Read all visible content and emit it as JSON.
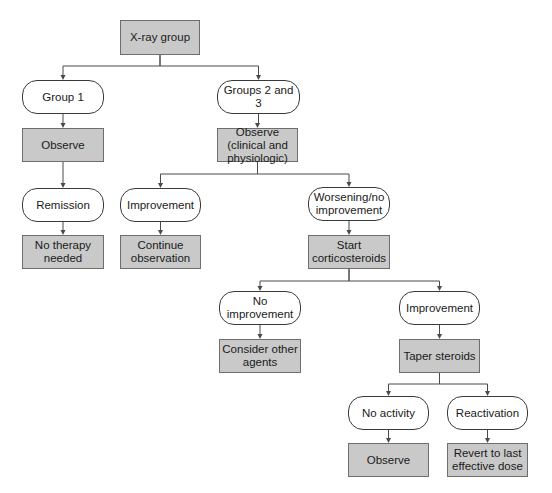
{
  "diagram": {
    "type": "flowchart",
    "nodes": {
      "xray": {
        "label": "X-ray group",
        "kind": "action"
      },
      "group1": {
        "label": "Group 1",
        "kind": "state"
      },
      "groups23": {
        "label": "Groups 2 and 3",
        "kind": "state"
      },
      "observe1": {
        "label": "Observe",
        "kind": "action"
      },
      "observe_clin": {
        "label": "Observe (clinical and physiologic)",
        "kind": "action"
      },
      "remission": {
        "label": "Remission",
        "kind": "state"
      },
      "improvement1": {
        "label": "Improvement",
        "kind": "state"
      },
      "worsening": {
        "label": "Worsening/no improvement",
        "kind": "state"
      },
      "no_therapy": {
        "label": "No therapy needed",
        "kind": "action"
      },
      "continue_obs": {
        "label": "Continue observation",
        "kind": "action"
      },
      "start_cortico": {
        "label": "Start corticosteroids",
        "kind": "action"
      },
      "no_improvement": {
        "label": "No improvement",
        "kind": "state"
      },
      "improvement2": {
        "label": "Improvement",
        "kind": "state"
      },
      "consider_other": {
        "label": "Consider other agents",
        "kind": "action"
      },
      "taper": {
        "label": "Taper steroids",
        "kind": "action"
      },
      "no_activity": {
        "label": "No activity",
        "kind": "state"
      },
      "reactivation": {
        "label": "Reactivation",
        "kind": "state"
      },
      "observe3": {
        "label": "Observe",
        "kind": "action"
      },
      "revert": {
        "label": "Revert to last effective dose",
        "kind": "action"
      }
    },
    "edges": [
      [
        "xray",
        "group1"
      ],
      [
        "xray",
        "groups23"
      ],
      [
        "group1",
        "observe1"
      ],
      [
        "observe1",
        "remission"
      ],
      [
        "remission",
        "no_therapy"
      ],
      [
        "groups23",
        "observe_clin"
      ],
      [
        "observe_clin",
        "improvement1"
      ],
      [
        "observe_clin",
        "worsening"
      ],
      [
        "improvement1",
        "continue_obs"
      ],
      [
        "worsening",
        "start_cortico"
      ],
      [
        "start_cortico",
        "no_improvement"
      ],
      [
        "start_cortico",
        "improvement2"
      ],
      [
        "no_improvement",
        "consider_other"
      ],
      [
        "improvement2",
        "taper"
      ],
      [
        "taper",
        "no_activity"
      ],
      [
        "taper",
        "reactivation"
      ],
      [
        "no_activity",
        "observe3"
      ],
      [
        "reactivation",
        "revert"
      ]
    ],
    "colors": {
      "action_fill": "#c9c9c9",
      "state_fill": "#ffffff",
      "line": "#4a4a4a"
    }
  }
}
